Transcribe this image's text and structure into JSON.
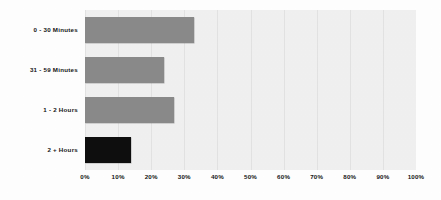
{
  "chart_data": {
    "type": "bar",
    "orientation": "horizontal",
    "title": "",
    "subtitle": "",
    "xlabel": "",
    "ylabel": "",
    "categories": [
      "0 - 30 Minutes",
      "31 - 59 Minutes",
      "1 - 2 Hours",
      "2 + Hours"
    ],
    "values": [
      33,
      24,
      27,
      14
    ],
    "value_suffix": "%",
    "xlim": [
      0,
      100
    ],
    "xticks": [
      0,
      10,
      20,
      30,
      40,
      50,
      60,
      70,
      80,
      90,
      100
    ],
    "xtick_labels": [
      "0%",
      "10%",
      "20%",
      "30%",
      "40%",
      "50%",
      "60%",
      "70%",
      "80%",
      "90%",
      "100%"
    ],
    "grid": true,
    "grid_axis": "x",
    "legend": false,
    "legend_position": "none",
    "bar_colors": [
      "#8a8a8a",
      "#8a8a8a",
      "#8a8a8a",
      "#0e0e0e"
    ],
    "plot_background": "#f1f1f1",
    "page_background": "#ffffff",
    "gridline_color": "#e3e3e3",
    "text_color": "#141414",
    "data_labels_shown": false
  }
}
